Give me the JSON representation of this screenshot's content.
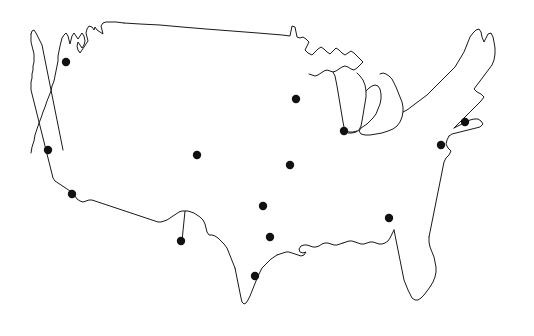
{
  "figure": {
    "type": "map",
    "title": "",
    "subtitle": "",
    "caption": "",
    "region": "Contiguous United States",
    "projection_hint": "equirectangular-like outline",
    "background_color": "#ffffff",
    "outline_color": "#1a1a1a",
    "outline_width_px": 1,
    "marker_color": "#111111",
    "marker_shape": "circle",
    "marker_radius_px": 4.2,
    "marker_count": 14,
    "has_labels": false,
    "has_legend": false,
    "has_axes": false,
    "has_gridlines": false,
    "has_fill": false
  },
  "chart_data": {
    "type": "scatter",
    "title": "",
    "xlabel": "",
    "ylabel": "",
    "xlim": [
      0,
      534
    ],
    "ylim": [
      336,
      0
    ],
    "grid": false,
    "legend": null,
    "series": [
      {
        "name": "city-markers",
        "marker": "circle",
        "color": "#111111",
        "points": [
          {
            "id": "p1",
            "x": 66,
            "y": 62
          },
          {
            "id": "p2",
            "x": 296,
            "y": 99
          },
          {
            "id": "p3",
            "x": 465,
            "y": 122
          },
          {
            "id": "p4",
            "x": 344,
            "y": 131
          },
          {
            "id": "p5",
            "x": 441,
            "y": 145
          },
          {
            "id": "p6",
            "x": 48,
            "y": 150
          },
          {
            "id": "p7",
            "x": 197,
            "y": 155
          },
          {
            "id": "p8",
            "x": 290,
            "y": 165
          },
          {
            "id": "p9",
            "x": 72,
            "y": 194
          },
          {
            "id": "p10",
            "x": 263,
            "y": 206
          },
          {
            "id": "p11",
            "x": 389,
            "y": 218
          },
          {
            "id": "p12",
            "x": 270,
            "y": 237
          },
          {
            "id": "p13",
            "x": 181,
            "y": 241
          },
          {
            "id": "p14",
            "x": 255,
            "y": 276
          }
        ]
      }
    ]
  },
  "geometry": {
    "mainland_outline": "M 70 36 L 73 30 L 76 34 L 79 30 L 80 36 L 83 38 L 86 34 L 88 30 L 91 28 L 94 30 L 95 26 L 97 30 L 100 31 L 103 28 L 104 33 L 107 32 L 110 29 L 112 33 L 114 30 L 116 26 L 119 22 L 122 25 L 124 30 L 121 34 L 119 39 L 122 42 L 125 39 L 127 35 L 129 31 L 131 27 L 133 23 L 136 20 L 140 21 L 145 22 L 152 23 L 160 24 L 170 25 L 182 26 L 196 27 L 212 28 L 230 30 L 250 31 L 268 33 L 282 34 L 290 35 L 291 30 L 293 27 L 296 28 L 298 31 L 300 33 L 303 32 L 305 36 L 308 39 L 312 41 L 316 43 L 320 46 L 318 50 L 316 54 L 319 57 L 323 59 L 327 57 L 331 55 L 333 59 L 336 62 L 340 60 L 344 58 L 348 60 L 352 63 L 350 67 L 347 71 L 344 75 L 341 79 L 345 82 L 349 85 L 352 82 L 355 79 L 356 83 L 353 87 L 350 91 L 347 95 L 345 100 L 348 104 L 352 107 L 356 110 L 360 113 L 364 116 L 368 119 L 372 121 L 376 123 L 380 125 L 384 127 L 388 126 L 392 124 L 396 121 L 400 118 L 404 114 L 408 110 L 412 106 L 416 102 L 420 98 L 424 95 L 428 92 L 432 89 L 436 86 L 440 83 L 444 80 L 448 77 L 452 74 L 456 70 L 460 66 L 463 61 L 466 56 L 469 51 L 472 46 L 474 41 L 477 36 L 480 31 L 483 27 L 486 24 L 489 22 L 492 25 L 494 30 L 496 35 L 497 41 L 498 47 L 499 53 L 500 59 L 499 65 L 497 70 L 494 75 L 491 79 L 488 83 L 485 87 L 482 91 L 479 95 L 476 99 L 473 103 L 470 107 L 467 111 L 464 115 L 461 119 L 458 123 L 455 127 L 453 132 L 451 137 L 449 142 L 447 147 L 445 152 L 443 157 L 441 162 L 439 167 L 437 172 L 435 177 L 433 182 L 431 187 L 429 192 L 427 197 L 425 202 L 423 207 L 422 212 L 421 217 L 420 222 L 419 227 L 420 232 L 422 237 L 424 242 L 426 247 L 428 252 L 429 257 L 430 262 L 430 267 L 429 272 L 427 277 L 424 282 L 421 287 L 418 291 L 415 294 L 412 296 L 409 297 L 406 296 L 404 293 L 402 289 L 400 285 L 398 281 L 396 277 L 394 273 L 392 269 L 390 265 L 388 262 L 386 266 L 383 269 L 380 271 L 377 272 L 374 271 L 371 269 L 368 267 L 365 265 L 362 264 L 359 264 L 356 265 L 353 266 L 350 267 L 347 266 L 344 264 L 341 263 L 338 264 L 335 266 L 332 267 L 329 266 L 326 264 L 323 263 L 320 264 L 317 265 L 314 266 L 311 265 L 308 263 L 305 262 L 302 263 L 299 265 L 296 266 L 293 265 L 290 263 L 287 262 L 284 263 L 281 265 L 278 267 L 275 270 L 272 274 L 270 278 L 268 283 L 266 288 L 264 293 L 262 298 L 260 302 L 257 305 L 254 306 L 251 304 L 249 300 L 247 295 L 245 290 L 243 285 L 241 280 L 239 275 L 237 270 L 235 265 L 233 260 L 231 255 L 229 250 L 227 245 L 224 241 L 221 238 L 218 236 L 215 235 L 212 236 L 209 238 L 206 240 L 203 241 L 200 241 L 197 240 L 194 239 L 191 239 L 188 240 L 185 241 L 182 241 L 179 240 L 176 239 L 173 238 L 170 238 L 167 239 L 164 240 L 161 240 L 158 239 L 155 238 L 152 238 L 149 239 L 146 240 L 143 240 L 140 239 L 137 237 L 134 235 L 131 233 L 128 231 L 125 229 L 122 227 L 119 225 L 116 223 L 113 221 L 110 219 L 107 217 L 104 215 L 101 213 L 98 211 L 95 209 L 92 207 L 89 205 L 86 202 L 83 199 L 80 196 L 77 193 L 74 190 L 72 186 L 70 182 L 68 178 L 66 174 L 64 170 L 62 166 L 60 162 L 58 158 L 56 154 L 54 150 L 52 146 L 51 142 L 50 138 L 49 134 L 48 130 L 47 126 L 46 122 L 45 118 L 45 114 L 46 110 L 48 106 L 50 102 L 52 98 L 54 94 L 56 90 L 58 86 L 60 82 L 62 78 L 64 74 L 66 70 L 67 65 L 68 60 L 69 55 L 69 50 L 69 45 L 70 40 Z"
  }
}
